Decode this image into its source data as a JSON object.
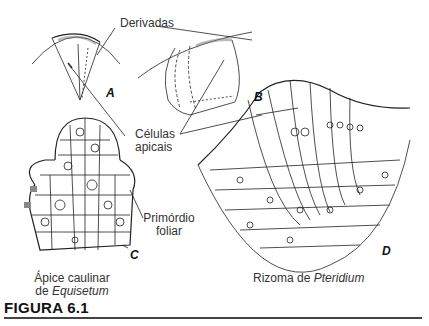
{
  "figure": {
    "caption": "FIGURA 6.1",
    "labels": {
      "derivadas": "Derivadas",
      "celulas_apicais_line1": "Células",
      "celulas_apicais_line2": "apicais",
      "primordio_line1": "Primórdio",
      "primordio_line2": "foliar",
      "panel_c_caption_line1": "Ápice caulinar",
      "panel_c_caption_line2_prefix": "de ",
      "panel_c_caption_line2_italic": "Equisetum",
      "panel_d_caption_prefix": "Rizoma de ",
      "panel_d_caption_italic": "Pteridium"
    },
    "panels": [
      {
        "letter": "A",
        "description": "Tetrahedral apical cell with derivatives"
      },
      {
        "letter": "B",
        "description": "Apical cell, lateral view"
      },
      {
        "letter": "C",
        "description": "Shoot apex of Equisetum"
      },
      {
        "letter": "D",
        "description": "Rhizome of Pteridium"
      }
    ]
  }
}
